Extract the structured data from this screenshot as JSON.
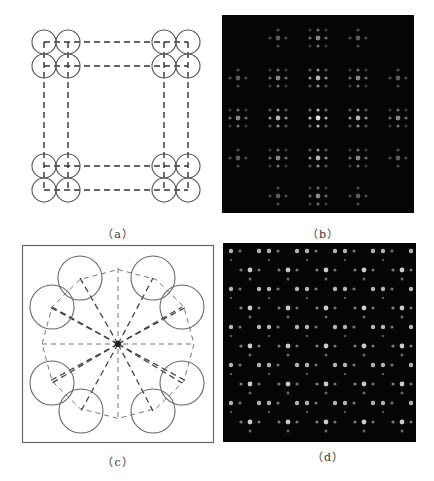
{
  "figure": {
    "panels": [
      {
        "id": "a",
        "caption": "（a）",
        "type": "schematic",
        "description": "4 clusters of 2x2 circles at corners of a square, connected by dashed lines"
      },
      {
        "id": "b",
        "caption": "（b）",
        "type": "diffraction-pattern",
        "description": "dark field with periodic spot clusters"
      },
      {
        "id": "c",
        "caption": "（c）",
        "type": "schematic",
        "description": "8 circles arranged on a ring with dashed radial lines to center, boxed"
      },
      {
        "id": "d",
        "caption": "（d）",
        "type": "diffraction-pattern",
        "description": "dark field with dense periodic dot lattice"
      }
    ]
  },
  "panel_a": {
    "circle_radius": 12,
    "circles": [
      [
        44,
        42
      ],
      [
        68,
        42
      ],
      [
        44,
        66
      ],
      [
        68,
        66
      ],
      [
        164,
        42
      ],
      [
        188,
        42
      ],
      [
        164,
        66
      ],
      [
        188,
        66
      ],
      [
        44,
        166
      ],
      [
        68,
        166
      ],
      [
        44,
        190
      ],
      [
        68,
        190
      ],
      [
        164,
        166
      ],
      [
        188,
        166
      ],
      [
        164,
        190
      ],
      [
        188,
        190
      ]
    ]
  },
  "panel_b": {
    "bg": "#050505",
    "cluster_x": [
      238,
      278,
      318,
      358,
      398
    ],
    "cluster_y": [
      38,
      78,
      118,
      158,
      196
    ]
  },
  "panel_c": {
    "center": [
      118,
      344
    ],
    "circle_radius": 15,
    "circles": [
      [
        80,
        278
      ],
      [
        153,
        278
      ],
      [
        52,
        307
      ],
      [
        182,
        307
      ],
      [
        52,
        383
      ],
      [
        182,
        383
      ],
      [
        81,
        411
      ],
      [
        153,
        411
      ]
    ]
  },
  "panel_d": {
    "bg": "#050505"
  },
  "colors": {
    "line": "#444444",
    "dark_bg": "#050505",
    "spot": "#d8d8d8"
  }
}
